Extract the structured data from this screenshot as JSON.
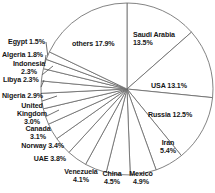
{
  "chart_data": {
    "type": "pie",
    "title": "",
    "subtitle": "",
    "xlabel": "",
    "ylabel": "",
    "legend_position": "none",
    "grid": false,
    "start_angle_deg": 0,
    "direction": "clockwise",
    "units": "percent",
    "center": {
      "x": 127,
      "y": 89
    },
    "radius": 86,
    "categories": [
      "Saudi Arabia",
      "USA",
      "Russia",
      "Iran",
      "Mexico",
      "China",
      "Venezuela",
      "UAE",
      "Norway",
      "Canada",
      "United Kingdom",
      "Nigeria",
      "Libya",
      "Indonesia",
      "Algeria",
      "Egypt",
      "others"
    ],
    "values": [
      13.5,
      13.1,
      12.5,
      5.4,
      4.9,
      4.5,
      4.1,
      3.8,
      3.4,
      3.1,
      3.0,
      2.9,
      2.3,
      2.3,
      1.8,
      1.5,
      17.9
    ],
    "slices": [
      {
        "label": "Saudi Arabia",
        "value": 13.5,
        "label_text": "Saudi Arabia\n13.5%"
      },
      {
        "label": "USA",
        "value": 13.1,
        "label_text": "USA 13.1%"
      },
      {
        "label": "Russia",
        "value": 12.5,
        "label_text": "Russia 12.5%"
      },
      {
        "label": "Iran",
        "value": 5.4,
        "label_text": "Iran\n5.4%"
      },
      {
        "label": "Mexico",
        "value": 4.9,
        "label_text": "Mexico\n4.9%"
      },
      {
        "label": "China",
        "value": 4.5,
        "label_text": "China\n4.5%"
      },
      {
        "label": "Venezuela",
        "value": 4.1,
        "label_text": "Venezuela\n4.1%"
      },
      {
        "label": "UAE",
        "value": 3.8,
        "label_text": "UAE 3.8%"
      },
      {
        "label": "Norway",
        "value": 3.4,
        "label_text": "Norway 3.4%"
      },
      {
        "label": "Canada",
        "value": 3.1,
        "label_text": "Canada\n3.1%"
      },
      {
        "label": "United Kingdom",
        "value": 3.0,
        "label_text": "United\nKingdom\n3.0%"
      },
      {
        "label": "Nigeria",
        "value": 2.9,
        "label_text": "Nigeria 2.9%"
      },
      {
        "label": "Libya",
        "value": 2.3,
        "label_text": "Libya 2.3%"
      },
      {
        "label": "Indonesia",
        "value": 2.3,
        "label_text": "Indonesia\n2.3%"
      },
      {
        "label": "Algeria",
        "value": 1.8,
        "label_text": "Algeria 1.8%"
      },
      {
        "label": "Egypt",
        "value": 1.5,
        "label_text": "Egypt 1.5%"
      },
      {
        "label": "others",
        "value": 17.9,
        "label_text": "others 17.9%"
      }
    ],
    "colors": {
      "slice_fill": "#ffffff",
      "slice_stroke": "#6d6d6d",
      "leader_line": "#4a4a4a",
      "text": "#161616",
      "background": "#ffffff"
    }
  },
  "labels": {
    "saudi_arabia": "Saudi Arabia\n13.5%",
    "usa": "USA 13.1%",
    "russia": "Russia 12.5%",
    "iran": "Iran\n5.4%",
    "mexico": "Mexico\n4.9%",
    "china": "China\n4.5%",
    "venezuela": "Venezuela\n4.1%",
    "uae": "UAE 3.8%",
    "norway": "Norway 3.4%",
    "canada": "Canada\n3.1%",
    "united_kingdom": "United\nKingdom\n3.0%",
    "nigeria": "Nigeria 2.9%",
    "libya": "Libya 2.3%",
    "indonesia": "Indonesia\n2.3%",
    "algeria": "Algeria 1.8%",
    "egypt": "Egypt 1.5%",
    "others": "others 17.9%"
  }
}
